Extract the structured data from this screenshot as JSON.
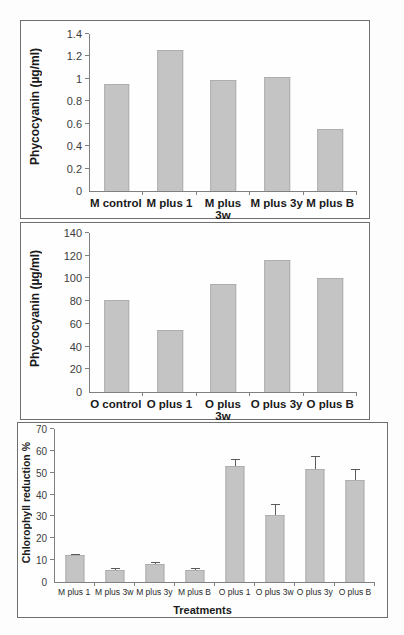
{
  "figure": {
    "background": "#fdfdfd",
    "panel_border_color": "#6f6f6f",
    "bar_color": "#c4c4c4",
    "axis_color": "#808080",
    "error_bar_color": "#5a5a5a"
  },
  "chart_data": [
    {
      "type": "bar",
      "title": "",
      "ylabel": "Phycocyanin (µg/ml)",
      "xlabel": "",
      "categories": [
        "M control",
        "M plus 1",
        "M plus 3w",
        "M plus 3y",
        "M plus B"
      ],
      "values": [
        0.95,
        1.26,
        0.99,
        1.02,
        0.55
      ],
      "ylim": [
        0,
        1.4
      ],
      "yticks": [
        "0",
        "0.2",
        "0.4",
        "0.6",
        "0.8",
        "1",
        "1.2",
        "1.4"
      ],
      "grid": false,
      "legend": null
    },
    {
      "type": "bar",
      "title": "",
      "ylabel": "Phycocyanin (µg/ml)",
      "xlabel": "",
      "categories": [
        "O control",
        "O plus 1",
        "O plus 3w",
        "O plus 3y",
        "O plus B"
      ],
      "values": [
        81,
        55,
        95,
        116,
        100
      ],
      "ylim": [
        0,
        140
      ],
      "yticks": [
        "0",
        "20",
        "40",
        "60",
        "80",
        "100",
        "120",
        "140"
      ],
      "grid": false,
      "legend": null
    },
    {
      "type": "bar",
      "title": "",
      "ylabel": "Chlorophyll reduction %",
      "xlabel": "Treatments",
      "categories": [
        "M plus 1",
        "M plus 3w",
        "M plus 3y",
        "M plus B",
        "O plus 1",
        "O plus 3w",
        "O plus 3y",
        "O plus B"
      ],
      "values": [
        12.3,
        5.5,
        8.2,
        5.7,
        53,
        30.5,
        51.5,
        46.5
      ],
      "errors": [
        0.7,
        1.0,
        0.8,
        0.8,
        3.5,
        5.0,
        6.0,
        5.0
      ],
      "ylim": [
        0,
        70
      ],
      "yticks": [
        "0",
        "10",
        "20",
        "30",
        "40",
        "50",
        "60",
        "70"
      ],
      "grid": false,
      "legend": null
    }
  ]
}
